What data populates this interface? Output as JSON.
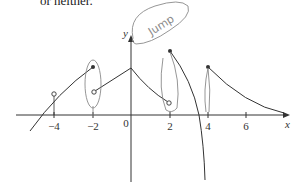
{
  "caption": "or neither.",
  "axes": {
    "x_label": "x",
    "y_label": "y",
    "origin_label": "0",
    "x_ticks": [
      {
        "label": "−4",
        "x": 54
      },
      {
        "label": "−2",
        "x": 93
      },
      {
        "label": "2",
        "x": 170
      },
      {
        "label": "4",
        "x": 208
      },
      {
        "label": "6",
        "x": 246
      }
    ]
  },
  "annotation": {
    "text": "Jump"
  },
  "graph": {
    "curve_color": "#333333",
    "annotation_color": "#8a8a8a",
    "segments": [
      {
        "description": "rising curve from left, open circle at x=-4, filled dot at x=-2",
        "open_points": [
          -4
        ],
        "filled_points": [
          -2
        ]
      },
      {
        "description": "line from open circle at x=-2 rising to peak at x=0",
        "open_points": [
          -2
        ],
        "filled_points": []
      },
      {
        "description": "decreasing curve from x=0 to open circle at x=2",
        "open_points": [
          2
        ],
        "filled_points": []
      },
      {
        "description": "filled dot at x=2, steeply decreasing toward vertical asymptote",
        "open_points": [],
        "filled_points": [
          2
        ]
      },
      {
        "description": "filled dot at x=4, decaying curve toward x axis",
        "open_points": [],
        "filled_points": [
          4
        ]
      }
    ]
  }
}
